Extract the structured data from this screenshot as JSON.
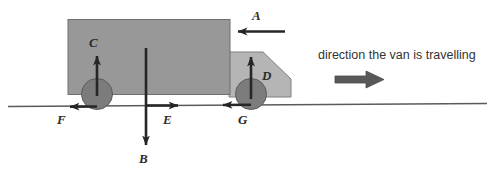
{
  "diagram": {
    "title_alt": "Free body force diagram of a van travelling on a road",
    "caption": {
      "text": "direction the van is travelling",
      "arrow_icon": "right-arrow-icon",
      "arrow_direction": "right"
    },
    "vehicle": {
      "body_name": "van-body",
      "cab_name": "van-cab",
      "wheels": [
        {
          "name": "rear-wheel"
        },
        {
          "name": "front-wheel"
        }
      ]
    },
    "ground": {
      "name": "ground-line"
    },
    "forces": [
      {
        "id": "A",
        "label": "A",
        "direction": "left",
        "applied_at": "front-of-van-body",
        "name": "force-arrow-a"
      },
      {
        "id": "B",
        "label": "B",
        "direction": "down",
        "applied_at": "centre-of-van",
        "name": "force-arrow-b"
      },
      {
        "id": "C",
        "label": "C",
        "direction": "up",
        "applied_at": "rear-wheel",
        "name": "force-arrow-c"
      },
      {
        "id": "D",
        "label": "D",
        "direction": "up",
        "applied_at": "front-wheel",
        "name": "force-arrow-d"
      },
      {
        "id": "E",
        "label": "E",
        "direction": "right",
        "applied_at": "centre-ground",
        "name": "force-arrow-e"
      },
      {
        "id": "F",
        "label": "F",
        "direction": "left",
        "applied_at": "rear-wheel-ground",
        "name": "force-arrow-f"
      },
      {
        "id": "G",
        "label": "G",
        "direction": "left",
        "applied_at": "front-wheel-ground",
        "name": "force-arrow-g"
      }
    ],
    "colors": {
      "van_body": "#989898",
      "van_cab": "#b5b5b5",
      "wheel": "#7c7c7c",
      "outline": "#4a4a4a",
      "arrow": "#262626",
      "ground": "#555555",
      "caption_arrow": "#555555",
      "text": "#2b2b2b",
      "background": "#ffffff"
    }
  }
}
